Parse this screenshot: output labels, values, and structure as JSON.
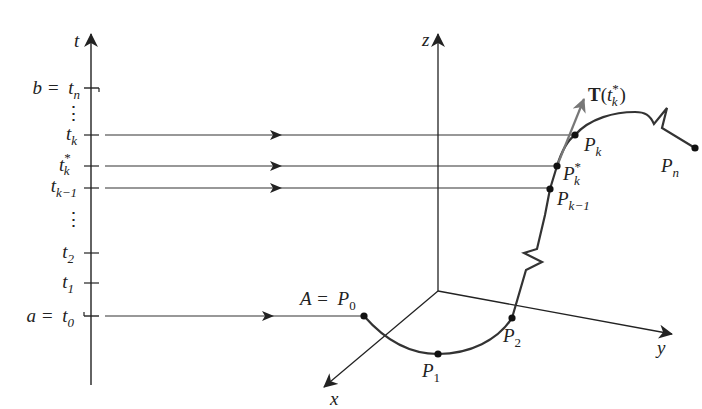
{
  "figure": {
    "type": "parametric-curve-partition-diagram",
    "colors": {
      "axis": "#222222",
      "curve": "#333333",
      "tangent_vector": "#777777",
      "point": "#111111",
      "background": "#ffffff"
    },
    "t_axis": {
      "label": "t",
      "ticks": [
        {
          "id": "tn",
          "lhs": "b =",
          "var": "t",
          "sub": "n",
          "sup": "",
          "y": 88
        },
        {
          "id": "tk",
          "lhs": "",
          "var": "t",
          "sub": "k",
          "sup": "",
          "y": 135
        },
        {
          "id": "tkstar",
          "lhs": "",
          "var": "t",
          "sub": "k",
          "sup": "*",
          "y": 166
        },
        {
          "id": "tkm1",
          "lhs": "",
          "var": "t",
          "sub": "k−1",
          "sup": "",
          "y": 188
        },
        {
          "id": "t2",
          "lhs": "",
          "var": "t",
          "sub": "2",
          "sup": "",
          "y": 253
        },
        {
          "id": "t1",
          "lhs": "",
          "var": "t",
          "sub": "1",
          "sup": "",
          "y": 283
        },
        {
          "id": "t0",
          "lhs": "a =",
          "var": "t",
          "sub": "0",
          "sup": "",
          "y": 316
        }
      ],
      "ellipsis_top": "⋮",
      "ellipsis_bottom": "⋮"
    },
    "axes_3d": {
      "x_label": "x",
      "y_label": "y",
      "z_label": "z"
    },
    "points": [
      {
        "id": "P0",
        "lhs": "A =",
        "var": "P",
        "sub": "0",
        "sup": ""
      },
      {
        "id": "P1",
        "lhs": "",
        "var": "P",
        "sub": "1",
        "sup": ""
      },
      {
        "id": "P2",
        "lhs": "",
        "var": "P",
        "sub": "2",
        "sup": ""
      },
      {
        "id": "Pkm1",
        "lhs": "",
        "var": "P",
        "sub": "k−1",
        "sup": ""
      },
      {
        "id": "Pkstar",
        "lhs": "",
        "var": "P",
        "sub": "k",
        "sup": "*"
      },
      {
        "id": "Pk",
        "lhs": "",
        "var": "P",
        "sub": "k",
        "sup": ""
      },
      {
        "id": "Pn",
        "lhs": "",
        "var": "P",
        "sub": "n",
        "sup": ""
      }
    ],
    "tangent": {
      "bold": "T",
      "open": "(",
      "var": "t",
      "sub": "k",
      "sup": "*",
      "close": ")"
    }
  }
}
